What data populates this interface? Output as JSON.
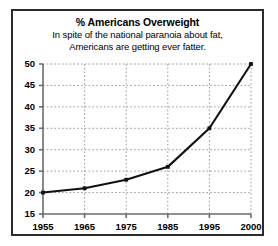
{
  "chart_data": {
    "type": "line",
    "title": "% Americans Overweight",
    "subtitle_lines": [
      "In spite of the national paranoia about fat,",
      "Americans are getting ever fatter."
    ],
    "xlabel": "",
    "ylabel": "",
    "categories": [
      "1955",
      "1965",
      "1975",
      "1985",
      "1995",
      "2000"
    ],
    "x": [
      1955,
      1965,
      1975,
      1985,
      1995,
      2000
    ],
    "values": [
      20,
      21,
      23,
      26,
      35,
      50
    ],
    "series": [
      {
        "name": "% Americans Overweight",
        "values": [
          20,
          21,
          23,
          26,
          35,
          50
        ]
      }
    ],
    "ylim": [
      15,
      50
    ],
    "yticks": [
      15,
      20,
      25,
      30,
      35,
      40,
      45,
      50
    ],
    "ytick_labels": [
      "15",
      "20",
      "25",
      "30",
      "35",
      "40",
      "45",
      "50"
    ],
    "xtick_labels": [
      "1955",
      "1965",
      "1975",
      "1985",
      "1995",
      "2000"
    ],
    "grid": true,
    "grid_style": "dotted",
    "legend": false,
    "legend_position": "none",
    "line_color": "#111111",
    "grid_color": "#9a9a9a",
    "axis_color": "#6b6b6b",
    "border_color": "#2b2b2b",
    "background_color": "#ffffff",
    "note": "X categories are evenly spaced even though 1995-2000 is a 5-year gap."
  }
}
